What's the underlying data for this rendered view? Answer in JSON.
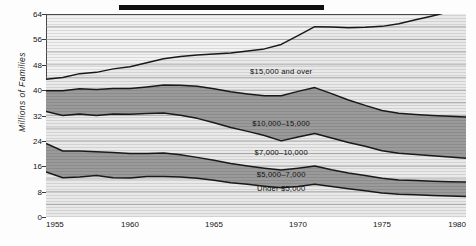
{
  "title_bar": {
    "name": "redacted-title-bar",
    "color": "#101010"
  },
  "axes": {
    "y_axis_title": "Millions of Families",
    "y_ticks": [
      0,
      8,
      16,
      24,
      32,
      40,
      48,
      56,
      64
    ],
    "x_ticks": [
      "1955",
      "1960",
      "1965",
      "1970",
      "1975",
      "1980"
    ]
  },
  "colors": {
    "plot_background": "#f2f2f2",
    "band_light": "#e9e9e9",
    "band_dark": "#9a9a9a",
    "boundary_line": "#1a1a1a",
    "gridline": "#9d9d9d",
    "frame": "#4a4a4a",
    "text": "#141414"
  },
  "chart_data": {
    "type": "area",
    "stacked": true,
    "title": "",
    "xlabel": "",
    "ylabel": "Millions of Families",
    "xlim": [
      1955,
      1980
    ],
    "ylim": [
      0,
      64
    ],
    "grid": true,
    "grid_step": 4,
    "legend": "inline-band-labels",
    "x": [
      1955,
      1956,
      1957,
      1958,
      1959,
      1960,
      1961,
      1962,
      1963,
      1964,
      1965,
      1966,
      1967,
      1968,
      1969,
      1970,
      1971,
      1972,
      1973,
      1974,
      1975,
      1976,
      1977,
      1978,
      1979,
      1980
    ],
    "series": [
      {
        "name": "Under $5,000",
        "label": "Under $5,000",
        "shade": "light",
        "values": [
          14.2,
          12.4,
          12.6,
          13.1,
          12.4,
          12.3,
          12.8,
          12.8,
          12.6,
          12.2,
          11.6,
          10.8,
          10.3,
          9.7,
          9.2,
          9.6,
          10.3,
          9.6,
          8.9,
          8.3,
          7.6,
          7.2,
          7.0,
          6.8,
          6.6,
          6.5
        ]
      },
      {
        "name": "$5,000-7,000",
        "label": "$5,000–7,000",
        "shade": "dark",
        "values": [
          9.0,
          8.4,
          8.2,
          7.5,
          7.9,
          7.7,
          7.2,
          7.4,
          7.0,
          6.6,
          6.3,
          6.1,
          5.8,
          5.7,
          5.6,
          5.8,
          5.8,
          5.3,
          5.0,
          4.8,
          4.6,
          4.5,
          4.5,
          4.5,
          4.5,
          4.5
        ]
      },
      {
        "name": "$7,000-10,000",
        "label": "$7,000–10,000",
        "shade": "light",
        "values": [
          10.1,
          11.2,
          11.7,
          11.4,
          12.2,
          12.4,
          12.6,
          12.6,
          12.5,
          12.3,
          11.8,
          11.3,
          10.9,
          10.3,
          9.2,
          9.8,
          10.2,
          10.0,
          9.6,
          9.2,
          8.7,
          8.4,
          8.2,
          8.0,
          7.8,
          7.5
        ]
      },
      {
        "name": "$10,000-15,000",
        "label": "$10,000–15,000",
        "shade": "dark",
        "values": [
          6.5,
          7.8,
          7.9,
          8.2,
          8.0,
          8.1,
          8.4,
          8.8,
          9.4,
          10.1,
          10.7,
          11.3,
          11.8,
          12.5,
          14.2,
          14.4,
          14.5,
          14.0,
          13.4,
          12.9,
          12.7,
          12.6,
          12.6,
          12.7,
          12.9,
          13.0
        ]
      },
      {
        "name": "$15,000 and over",
        "label": "$15,000 and over",
        "shade": "light",
        "values": [
          3.6,
          4.2,
          4.8,
          5.4,
          6.2,
          6.9,
          7.6,
          8.3,
          9.1,
          9.9,
          11.0,
          12.2,
          13.5,
          14.8,
          16.2,
          17.6,
          19.2,
          21.0,
          22.8,
          24.6,
          26.5,
          28.2,
          29.9,
          31.4,
          32.9,
          34.2
        ]
      }
    ],
    "band_label_positions": [
      {
        "label": "$15,000 and over",
        "x": 1969.0,
        "y": 46.0
      },
      {
        "label": "$10,000–15,000",
        "x": 1969.0,
        "y": 29.5
      },
      {
        "label": "$7,000–10,000",
        "x": 1969.0,
        "y": 20.6
      },
      {
        "label": "$5,000–7,000",
        "x": 1969.0,
        "y": 13.5
      },
      {
        "label": "Under $5,000",
        "x": 1969.0,
        "y": 9.2
      }
    ]
  }
}
